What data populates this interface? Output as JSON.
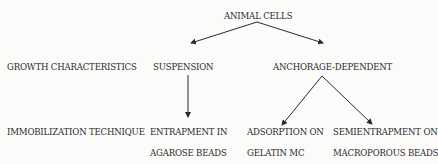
{
  "diagram": {
    "root": "ANIMAL CELLS",
    "row_labels": {
      "growth": "GROWTH CHARACTERISTICS",
      "immobilization": "IMMOBILIZATION TECHNIQUE"
    },
    "growth_types": {
      "suspension": "SUSPENSION",
      "anchorage": "ANCHORAGE-DEPENDENT"
    },
    "techniques": {
      "entrapment_line1": "ENTRAPMENT IN",
      "entrapment_line2": "AGAROSE BEADS",
      "adsorption_line1": "ADSORPTION ON",
      "adsorption_line2": "GELATIN MC",
      "semientrapment_line1": "SEMIENTRAPMENT ON",
      "semientrapment_line2": "MACROPOROUS BEADS"
    },
    "edges": [
      {
        "from": "ANIMAL CELLS",
        "to": "SUSPENSION"
      },
      {
        "from": "ANIMAL CELLS",
        "to": "ANCHORAGE-DEPENDENT"
      },
      {
        "from": "SUSPENSION",
        "to": "ENTRAPMENT IN AGAROSE BEADS"
      },
      {
        "from": "ANCHORAGE-DEPENDENT",
        "to": "ADSORPTION ON GELATIN MC"
      },
      {
        "from": "ANCHORAGE-DEPENDENT",
        "to": "SEMIENTRAPMENT ON MACROPOROUS BEADS"
      }
    ],
    "colors": {
      "ink": "#2a2a2a",
      "background": "#fbfbfa"
    }
  }
}
